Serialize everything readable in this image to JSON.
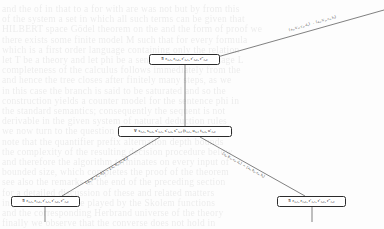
{
  "diagram": {
    "type": "proof-tree",
    "nodes": [
      {
        "id": "top",
        "quantifier": "∃",
        "text": "∃ r₄,₁, r₄,₂, r′₄,₁, r′₄,₂, r″₄,₂"
      },
      {
        "id": "middle",
        "quantifier": "∀",
        "text": "∀ s₄,₁, s₄,₂, s′₄,₁, s′₄,₂, s″₄,₂ (t₄,₁, u₄,₁ t₄,₂, u′₄,₂"
      },
      {
        "id": "bottom-left",
        "quantifier": "∃",
        "text": "∃ r₄,₁, r₄,₂, r′₄,₁, r′₄,₂, r″₄,₂"
      },
      {
        "id": "bottom-right",
        "quantifier": "∃",
        "text": "∃ r₄,₁, r₄,₂, r′₄,₁, r′₄,₂, r″₄,₂"
      }
    ],
    "edge_labels": [
      {
        "id": "top-right-edge",
        "text": "⟨a₄, b′₄, c₄, d₄⟩ → ⟨a₄, b′₄, e₄, h₄⟩"
      },
      {
        "id": "left-branch-edge",
        "text": "⟨a₄, b′₄, c₄, d₄⟩ → ⟨a₄, b₄, e₄, h′₄⟩"
      },
      {
        "id": "right-branch-edge",
        "text": "⟨a₄, b′₄, c₄, d₄⟩ → ⟨a₄, b₄, e₄, h₄⟩"
      }
    ],
    "colors": {
      "stroke": "#2b2b2b",
      "node_fill": "#ffffff",
      "text": "#111111",
      "background": "#fdfdfd",
      "watermark": "#3a3a3a"
    },
    "background_watermark": [
      "and the of in that to a for with are was not but by from this",
      "of the system a set in which all such terms can be given that",
      "HILBERT space Gödel theorem on the and the form of proof we",
      "there exists some finite model M such that for every formula",
      "which is a first order language containing only the relation",
      "let T be a theory and let phi be a sentence of the language L",
      "completeness of the calculus follows immediately from the",
      "and hence the tree closes after finitely many steps, as we",
      "in this case the branch is said to be saturated and so the",
      "construction yields a counter model for the sentence phi in",
      "the standard semantics; consequently the sequent is not",
      "derivable in the given system of natural deduction rules",
      "we now turn to the question of decidability for fragments",
      "note that the quantifier prefix alternation depth bounds",
      "the complexity of the resulting decision procedure below",
      "and therefore the algorithm terminates on every input of",
      "bounded size, which completes the proof of the theorem",
      "see also the remarks at the end of the preceding section",
      "for a detailed discussion of these and related matters",
      "in particular the role played by the Skolem functions",
      "and the corresponding Herbrand universe of the theory",
      "finally we observe that the converse does not hold in"
    ]
  }
}
